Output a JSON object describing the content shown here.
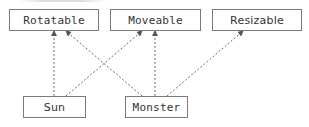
{
  "diagram": {
    "type": "class-interface-diagram",
    "nodes": [
      {
        "id": "rotatable",
        "label": "Rotatable",
        "kind": "interface"
      },
      {
        "id": "moveable",
        "label": "Moveable",
        "kind": "interface"
      },
      {
        "id": "resizable",
        "label": "Resizable",
        "kind": "interface"
      },
      {
        "id": "sun",
        "label": "Sun",
        "kind": "class"
      },
      {
        "id": "monster",
        "label": "Monster",
        "kind": "class"
      }
    ],
    "edges": [
      {
        "from": "sun",
        "to": "rotatable",
        "style": "dashed-arrow"
      },
      {
        "from": "sun",
        "to": "moveable",
        "style": "dashed-arrow"
      },
      {
        "from": "monster",
        "to": "rotatable",
        "style": "dashed-arrow"
      },
      {
        "from": "monster",
        "to": "moveable",
        "style": "dashed-arrow"
      },
      {
        "from": "monster",
        "to": "resizable",
        "style": "dashed-arrow"
      }
    ],
    "colors": {
      "box_border": "#7a7a7a",
      "edge": "#6e6e6e",
      "text": "#333333",
      "background": "#ffffff"
    }
  }
}
